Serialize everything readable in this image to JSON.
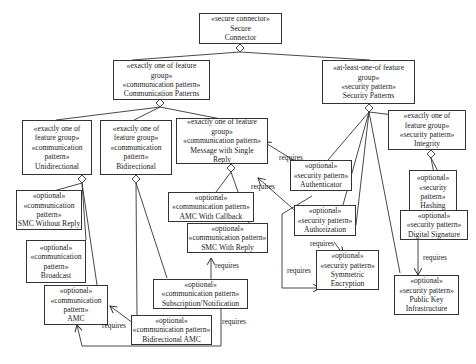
{
  "nodes": {
    "secure_connector": {
      "lines": [
        "«secure connector»",
        "Secure",
        "Connector"
      ]
    },
    "communication_patterns": {
      "lines": [
        "«exactly one of feature",
        "group»",
        "«communication pattern»",
        "Communication Patterns"
      ]
    },
    "security_patterns": {
      "lines": [
        "«at-least-one-of feature",
        "group»",
        "«security pattern»",
        "Security Patterns"
      ]
    },
    "unidirectional": {
      "lines": [
        "«exactly one of",
        "feature group»",
        "«communication",
        "pattern»",
        "Unidirectional"
      ]
    },
    "bidirectional": {
      "lines": [
        "«exactly one of",
        "feature group»",
        "«communication",
        "pattern»",
        "Bidirectional"
      ]
    },
    "message_single_reply": {
      "lines": [
        "«exactly one of feature",
        "group»",
        "«communication pattern»",
        "Message with Single",
        "Reply"
      ]
    },
    "integrity": {
      "lines": [
        "«exactly one of",
        "feature group»",
        "«security pattern»",
        "Integrity"
      ]
    },
    "authenticator": {
      "lines": [
        "«optional»",
        "«security pattern»",
        "Authenticator"
      ]
    },
    "hashing": {
      "lines": [
        "«optional»",
        "«security",
        "pattern»",
        "Hashing"
      ]
    },
    "smc_without_reply": {
      "lines": [
        "«optional»",
        "«communication",
        "pattern»",
        "SMC Without Reply"
      ]
    },
    "amc_with_callback": {
      "lines": [
        "«optional»",
        "«communication pattern»",
        "AMC With Callback"
      ]
    },
    "authorization": {
      "lines": [
        "«optional»",
        "«security pattern»",
        "Authorization"
      ]
    },
    "digital_signature": {
      "lines": [
        "«optional»",
        "«security pattern»",
        "Digital Signature"
      ]
    },
    "broadcast": {
      "lines": [
        "«optional»",
        "«communication",
        "pattern»",
        "Broadcast"
      ]
    },
    "smc_with_reply": {
      "lines": [
        "«optional»",
        "«communication pattern»",
        "SMC With Reply"
      ]
    },
    "symmetric_encryption": {
      "lines": [
        "«optional»",
        "«security pattern»",
        "Symmetric",
        "Encryption"
      ]
    },
    "subscription_notification": {
      "lines": [
        "«optional»",
        "«communication pattern»",
        "Subscription/Notification"
      ]
    },
    "amc": {
      "lines": [
        "«optional»",
        "«communication",
        "pattern»",
        "AMC"
      ]
    },
    "public_key_infrastructure": {
      "lines": [
        "«optional»",
        "«security pattern»",
        "Public Key",
        "Infrastructure"
      ]
    },
    "bidirectional_amc": {
      "lines": [
        "«optional»",
        "«communication pattern»",
        "Bidirectional AMC"
      ]
    }
  },
  "edge_labels": {
    "requires": "requires"
  },
  "requires_relations": [
    {
      "from": "Authenticator",
      "to": "Message with Single Reply"
    },
    {
      "from": "Authorization",
      "to": "Message with Single Reply"
    },
    {
      "from": "Authorization",
      "to": "Symmetric Encryption"
    },
    {
      "from": "Authenticator",
      "to": "Symmetric Encryption"
    },
    {
      "from": "Digital Signature",
      "to": "Public Key Infrastructure"
    },
    {
      "from": "Subscription/Notification",
      "to": "SMC With Reply"
    },
    {
      "from": "Bidirectional AMC",
      "to": "AMC"
    },
    {
      "from": "Subscription/Notification",
      "to": "AMC"
    }
  ]
}
